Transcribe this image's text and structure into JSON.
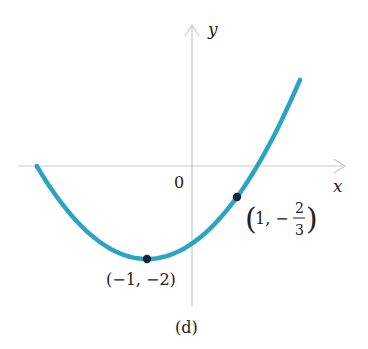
{
  "figure": {
    "caption": "(d)",
    "axes": {
      "x_label": "x",
      "y_label": "y",
      "origin_label": "0",
      "axis_color": "#c8c8c8"
    },
    "curve": {
      "color": "#2aa3c4",
      "description": "upward-opening parabola y = (1/3)(x+1)^2 - 2",
      "x_range": [
        -3.45,
        2.4
      ]
    },
    "points": [
      {
        "label": "(−1, −2)",
        "x": -1,
        "y": -2
      },
      {
        "label_prefix": "1, −",
        "numerator": "2",
        "denominator": "3",
        "x": 1,
        "y": -0.6667
      }
    ],
    "point_color": "#12263a"
  },
  "chart_data": {
    "type": "line",
    "title": "(d)",
    "xlabel": "x",
    "ylabel": "y",
    "function": "y = (1/3)(x+1)^2 - 2",
    "series": [
      {
        "name": "parabola",
        "x": [
          -3.45,
          -3,
          -2,
          -1,
          0,
          1,
          1.45,
          2,
          2.4
        ],
        "y": [
          0,
          -0.67,
          -1.67,
          -2,
          -1.67,
          -0.67,
          0,
          1,
          1.85
        ]
      }
    ],
    "labeled_points": [
      {
        "label": "(-1, -2)",
        "x": -1,
        "y": -2
      },
      {
        "label": "(1, -2/3)",
        "x": 1,
        "y": -0.6667
      }
    ],
    "xlim": [
      -3.8,
      3.4
    ],
    "ylim": [
      -3.05,
      3.0
    ],
    "grid": false
  }
}
